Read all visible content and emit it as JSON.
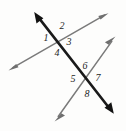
{
  "figure": {
    "width": 126,
    "height": 131,
    "background_color": "#fdfdfc",
    "lines": [
      {
        "id": "transversal",
        "name": "transversal-line",
        "style": "thick-black",
        "color": "#1a1a1a",
        "stroke_width": 2.6,
        "arrowheads": "both",
        "x1": 35.0,
        "y1": 13.0,
        "x2": 113.0,
        "y2": 113.0
      },
      {
        "id": "line-a",
        "name": "upper-gray-line",
        "style": "thin-gray",
        "color": "#7a7a7a",
        "stroke_width": 1.5,
        "arrowheads": "both",
        "x1": 9.0,
        "y1": 70.0,
        "x2": 108.0,
        "y2": 13.5
      },
      {
        "id": "line-b",
        "name": "lower-gray-line",
        "style": "thin-gray",
        "color": "#7a7a7a",
        "stroke_width": 1.5,
        "arrowheads": "both",
        "x1": 55.0,
        "y1": 121.0,
        "x2": 115.0,
        "y2": 37.0
      }
    ],
    "intersections": [
      {
        "id": "upper",
        "name": "upper-intersection-point",
        "x": 56.0,
        "y": 38.0
      },
      {
        "id": "lower",
        "name": "lower-intersection-point",
        "x": 84.0,
        "y": 80.0
      }
    ],
    "angle_labels": [
      {
        "id": "a1",
        "text": "1",
        "x": 41,
        "y": 33,
        "vertex": "upper",
        "position": "left"
      },
      {
        "id": "a2",
        "text": "2",
        "x": 57,
        "y": 21,
        "vertex": "upper",
        "position": "top"
      },
      {
        "id": "a3",
        "text": "3",
        "x": 64,
        "y": 37,
        "vertex": "upper",
        "position": "right"
      },
      {
        "id": "a4",
        "text": "4",
        "x": 52,
        "y": 48,
        "vertex": "upper",
        "position": "bottom"
      },
      {
        "id": "a5",
        "text": "5",
        "x": 68,
        "y": 74,
        "vertex": "lower",
        "position": "left"
      },
      {
        "id": "a6",
        "text": "6",
        "x": 80,
        "y": 61,
        "vertex": "lower",
        "position": "top"
      },
      {
        "id": "a7",
        "text": "7",
        "x": 93,
        "y": 73,
        "vertex": "lower",
        "position": "right"
      },
      {
        "id": "a8",
        "text": "8",
        "x": 82,
        "y": 89,
        "vertex": "lower",
        "position": "bottom"
      }
    ]
  }
}
